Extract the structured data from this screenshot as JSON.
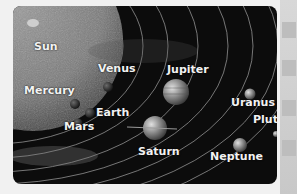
{
  "diagram": {
    "bodies": [
      {
        "name": "Sun",
        "label_x": 34,
        "label_y": 40
      },
      {
        "name": "Venus",
        "label_x": 98,
        "label_y": 62
      },
      {
        "name": "Jupiter",
        "label_x": 167,
        "label_y": 63
      },
      {
        "name": "Mercury",
        "label_x": 24,
        "label_y": 84
      },
      {
        "name": "Earth",
        "label_x": 96,
        "label_y": 106
      },
      {
        "name": "Mars",
        "label_x": 64,
        "label_y": 120
      },
      {
        "name": "Uranus",
        "label_x": 231,
        "label_y": 96
      },
      {
        "name": "Pluto",
        "label_x": 253,
        "label_y": 113
      },
      {
        "name": "Saturn",
        "label_x": 138,
        "label_y": 145
      },
      {
        "name": "Neptune",
        "label_x": 210,
        "label_y": 150
      }
    ],
    "colors": {
      "background": "#0c0c0c",
      "sun": "#8a8a8a",
      "orbit": "#bfbfbf",
      "label": "#f2f2f2",
      "page": "#f1f1f1"
    }
  }
}
